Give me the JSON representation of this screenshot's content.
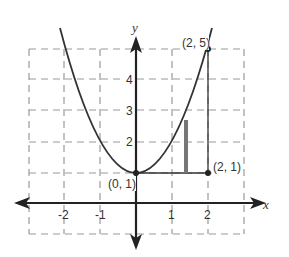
{
  "diagram": {
    "type": "function-graph",
    "function": "y = x^2 + 1",
    "axes": {
      "x_label": "x",
      "y_label": "y",
      "x_ticks": [
        "-2",
        "-1",
        "1",
        "2"
      ],
      "y_ticks": [
        "2",
        "3",
        "4"
      ],
      "x_range": [
        -3,
        3
      ],
      "y_range": [
        -1,
        5
      ]
    },
    "points": [
      {
        "label": "(2, 5)",
        "x": 2,
        "y": 5
      },
      {
        "label": "(0, 1)",
        "x": 0,
        "y": 1
      },
      {
        "label": "(2, 1)",
        "x": 2,
        "y": 1
      }
    ],
    "segments": [
      {
        "name": "horizontal-segment",
        "from": [
          0,
          1
        ],
        "to": [
          2,
          1
        ]
      },
      {
        "name": "vertical-segment",
        "from": [
          2,
          1
        ],
        "to": [
          2,
          5
        ]
      }
    ],
    "shaded_bar": {
      "x": 1.4,
      "y_bottom": 1,
      "y_top": 2.7
    },
    "colors": {
      "curve": "#333333",
      "grid": "#888888",
      "axis": "#222222",
      "bar": "#777777"
    }
  }
}
